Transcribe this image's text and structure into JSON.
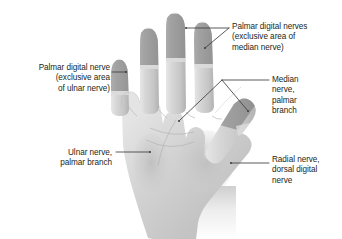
{
  "figure": {
    "view": "palmar",
    "colors": {
      "text": "#231f20",
      "leader_line": "#3d3d3d",
      "skin_light": "#d8d8d8",
      "skin_mid": "#c2c2c2",
      "skin_shadow": "#a8a8a8",
      "nerve_territory_shade": "#9a9a9a",
      "background": "#ffffff"
    }
  },
  "labels": {
    "ulnar_digital": {
      "text": "Palmar digital nerve\n(exclusive area\nof ulnar nerve)",
      "align": "right"
    },
    "median_digital": {
      "text": "Palmar digital nerves\n(exclusive area of\nmedian nerve)",
      "align": "left"
    },
    "median_palmar": {
      "text": "Median\nnerve,\npalmar\nbranch",
      "align": "left"
    },
    "ulnar_palmar": {
      "text": "Ulnar nerve,\npalmar branch",
      "align": "right"
    },
    "radial_dorsal": {
      "text": "Radial nerve,\ndorsal digital\nnerve",
      "align": "left"
    }
  },
  "leaders": [
    {
      "name": "ulnar-digital-leader",
      "points": "112,72 126,72"
    },
    {
      "name": "median-digital-leader-middle",
      "points": "229,28 186,28"
    },
    {
      "name": "median-digital-leader-ring",
      "points": "229,28 205,48"
    },
    {
      "name": "median-palmar-leader-stem",
      "points": "269,80 222,80"
    },
    {
      "name": "median-palmar-leader-palm",
      "points": "222,80 179,121"
    },
    {
      "name": "median-palmar-leader-thumb",
      "points": "222,80 248,111"
    },
    {
      "name": "ulnar-palmar-leader",
      "points": "116,152 150,152"
    },
    {
      "name": "radial-dorsal-leader",
      "points": "269,163 231,163"
    }
  ],
  "anatomy_regions": [
    {
      "name": "little-finger-distal",
      "nerve": "ulnar",
      "shaded": true
    },
    {
      "name": "ring-finger-distal",
      "nerve": "median",
      "shaded": true
    },
    {
      "name": "middle-finger-distal",
      "nerve": "median",
      "shaded": true
    },
    {
      "name": "index-finger-distal",
      "nerve": "median",
      "shaded": true
    },
    {
      "name": "thumb-distal",
      "nerve": "median",
      "shaded": true
    },
    {
      "name": "palm",
      "nerve": "median-and-ulnar-palmar-branches",
      "shaded": false
    },
    {
      "name": "hypothenar-eminence",
      "nerve": "ulnar-palmar-branch",
      "shaded": false
    },
    {
      "name": "thenar-eminence",
      "nerve": "median-palmar-branch",
      "shaded": false
    },
    {
      "name": "wrist",
      "nerve": "none",
      "shaded": false
    }
  ]
}
